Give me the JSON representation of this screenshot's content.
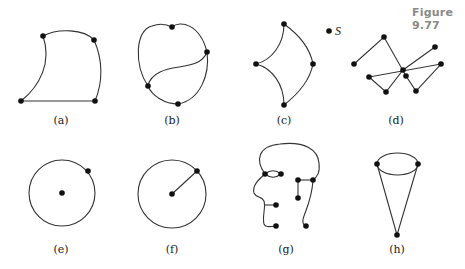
{
  "figure": {
    "title": "Figure 9.77",
    "title_color": "#8a8a8a",
    "stroke_color": "#333333",
    "vertex_color": "#111111"
  },
  "panels": [
    {
      "id": "a",
      "label": "(a)",
      "description": "curved quadrilateral with 4 vertices"
    },
    {
      "id": "b",
      "label": "(b)",
      "description": "heart-shaped closed curve with inner S-curve, 4 vertices"
    },
    {
      "id": "c",
      "label": "(c)",
      "description": "curvilinear four-vertex region",
      "extra_point_label": "S"
    },
    {
      "id": "d",
      "label": "(d)",
      "description": "zigzag graph of straight edges, 9 vertices"
    },
    {
      "id": "e",
      "label": "(e)",
      "description": "circle with center point and one point on circle"
    },
    {
      "id": "f",
      "label": "(f)",
      "description": "circle with radius segment from center to point on circle"
    },
    {
      "id": "g",
      "label": "(g)",
      "description": "head-profile drawing with vertices"
    },
    {
      "id": "h",
      "label": "(h)",
      "description": "cone: ellipse top with two lines to apex"
    }
  ]
}
